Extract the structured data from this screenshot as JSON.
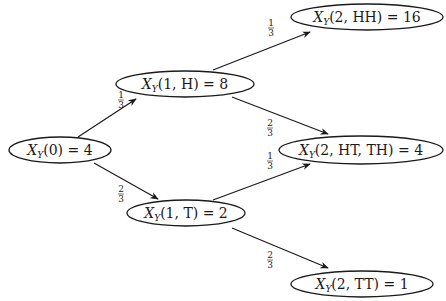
{
  "diagram": {
    "type": "probability-tree",
    "nodes": [
      {
        "id": "x0",
        "var": "X",
        "sub": "Y",
        "args": "(0)",
        "value": "4",
        "text": "X_Y(0) = 4"
      },
      {
        "id": "x1h",
        "var": "X",
        "sub": "Y",
        "args": "(1, H)",
        "value": "8",
        "text": "X_Y(1, H) = 8"
      },
      {
        "id": "x1t",
        "var": "X",
        "sub": "Y",
        "args": "(1, T)",
        "value": "2",
        "text": "X_Y(1, T) = 2"
      },
      {
        "id": "x2hh",
        "var": "X",
        "sub": "Y",
        "args": "(2, HH)",
        "value": "16",
        "text": "X_Y(2, HH) = 16"
      },
      {
        "id": "x2htth",
        "var": "X",
        "sub": "Y",
        "args": "(2, HT, TH)",
        "value": "4",
        "text": "X_Y(2, HT, TH) = 4"
      },
      {
        "id": "x2tt",
        "var": "X",
        "sub": "Y",
        "args": "(2, TT)",
        "value": "1",
        "text": "X_Y(2, TT) = 1"
      }
    ],
    "edges": [
      {
        "from": "x0",
        "to": "x1h",
        "prob_num": "1",
        "prob_den": "3"
      },
      {
        "from": "x0",
        "to": "x1t",
        "prob_num": "2",
        "prob_den": "3"
      },
      {
        "from": "x1h",
        "to": "x2hh",
        "prob_num": "1",
        "prob_den": "3"
      },
      {
        "from": "x1h",
        "to": "x2htth",
        "prob_num": "2",
        "prob_den": "3"
      },
      {
        "from": "x1t",
        "to": "x2htth",
        "prob_num": "1",
        "prob_den": "3"
      },
      {
        "from": "x1t",
        "to": "x2tt",
        "prob_num": "2",
        "prob_den": "3"
      }
    ]
  }
}
